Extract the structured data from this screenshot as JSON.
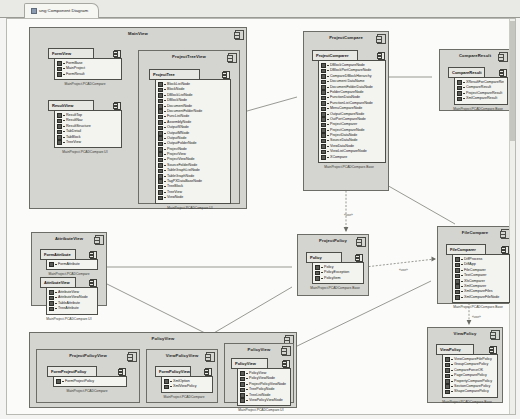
{
  "tab": {
    "label": "ung Component Diagram",
    "icon": "diagram-icon"
  },
  "colors": {
    "package_fill": "#d4d4d0",
    "component_fill": "#f3f3f0",
    "component_header_fill": "#e7e7e3",
    "canvas": "#fbfbf9",
    "line": "#6d6d68"
  },
  "packages": [
    {
      "id": "mainview",
      "name": "MainView",
      "x": 22,
      "y": 8,
      "w": 218,
      "h": 182,
      "components": [
        {
          "id": "formview",
          "name": "FormView",
          "x": 18,
          "y": 20,
          "w": 74,
          "h": 40,
          "footer": "MainProject.PCADCompare",
          "items": [
            "FormBase",
            "MainProject",
            "FormResult"
          ]
        },
        {
          "id": "resultview",
          "name": "ResultView",
          "x": 18,
          "y": 72,
          "w": 74,
          "h": 58,
          "footer": "MainProject.PCADCompare.UI",
          "items": [
            "ResultTop",
            "ResultNav",
            "ResultStructure",
            "TabDetail",
            "TabBlock",
            "TreeView"
          ]
        }
      ],
      "subpackages": [
        {
          "id": "projecttreeview",
          "name": "ProjectTreeView",
          "x": 108,
          "y": 22,
          "w": 102,
          "h": 154,
          "components": [
            {
              "id": "projecttree",
              "name": "ProjectTree",
              "x": 10,
              "y": 18,
              "w": 82,
              "h": 124,
              "footer": "MainProject.PCADCompare.UI",
              "items": [
                "BlockListNode",
                "BlockNode",
                "DBlockListNode",
                "DBlockNode",
                "DocumentNode",
                "DocumentFolderNode",
                "FuncListNode",
                "AssemblyNode",
                "OutputSNode",
                "OutputMNode",
                "OutputNode",
                "OutputFolderNode",
                "ProjectNode",
                "ProjectView",
                "ProjectViewNode",
                "SourceFolderNode",
                "TableGraphListNode",
                "TableGraphNode",
                "TagPXDataBaseNode",
                "TreeBlock",
                "TreeView",
                "ViewNode"
              ]
            }
          ]
        }
      ]
    },
    {
      "id": "projectcompare",
      "name": "ProjectCompare",
      "x": 296,
      "y": 12,
      "w": 86,
      "h": 160,
      "components": [
        {
          "id": "projectcomparer",
          "name": "ProjectComparer",
          "x": 8,
          "y": 18,
          "w": 74,
          "h": 128,
          "footer": "MainProject.PCADCompare.Base",
          "items": [
            "DBlockCompareNode",
            "DBlockPortCompareNode",
            "CompareDBlockHierarchy",
            "Document DataName",
            "DocumentFolderDataNode",
            "FolderCompareNode",
            "FunctionDataNode",
            "FunctionListCompareNode",
            "MenuCompareNode",
            "OutputCompareNode",
            "OutPortCompareNode",
            "ProjectComparer",
            "ProjectCompareNode",
            "ProjectDataNode",
            "SourceDataNode",
            "ViewDataNode",
            "ViewListCompareNode",
            "XCompare"
          ]
        }
      ]
    },
    {
      "id": "compareresult",
      "name": "CompareResult",
      "x": 432,
      "y": 30,
      "w": 72,
      "h": 62,
      "components": [
        {
          "id": "compareresult-comp",
          "name": "CompareResult",
          "x": 8,
          "y": 17,
          "w": 60,
          "h": 36,
          "footer": "MainProject.PCADCompare.Base",
          "items": [
            "XResultForCompareResult",
            "CompareResult",
            "ProjectCompareResult",
            "XmlCompareResult"
          ]
        }
      ]
    },
    {
      "id": "filecompare",
      "name": "FileCompare",
      "x": 430,
      "y": 207,
      "w": 76,
      "h": 78,
      "components": [
        {
          "id": "filecomparer",
          "name": "FileComparer",
          "x": 8,
          "y": 17,
          "w": 64,
          "h": 52,
          "footer": "MainProject.PCADCompare.Base",
          "items": [
            "DiffProcess",
            "DiffApp",
            "FileComparer",
            "TextComparer",
            "XlsComparer",
            "XmlComparer",
            "XmlCompareFiles",
            "XmlCompareFileNode"
          ]
        }
      ]
    },
    {
      "id": "projectpolicy",
      "name": "ProjectPolicy",
      "x": 290,
      "y": 215,
      "w": 72,
      "h": 62,
      "components": [
        {
          "id": "policy",
          "name": "Policy",
          "x": 8,
          "y": 17,
          "w": 58,
          "h": 32,
          "footer": "MainProject.PCADCompare.Base",
          "items": [
            "Policy",
            "PolicyException",
            "PolicyItem"
          ]
        }
      ]
    },
    {
      "id": "attributeview",
      "name": "AttributeView",
      "x": 24,
      "y": 213,
      "w": 76,
      "h": 74,
      "components": [
        {
          "id": "formattribute",
          "name": "FormAttribute",
          "x": 8,
          "y": 16,
          "w": 58,
          "h": 22,
          "footer": "MainProject.PCADCompare",
          "items": [
            "FormAttribute"
          ]
        },
        {
          "id": "attributeview-comp",
          "name": "AttributeView",
          "x": 8,
          "y": 44,
          "w": 58,
          "h": 30,
          "footer": "MainProject.PCADCompare.UI",
          "items": [
            "AttributeView",
            "AttributeViewNode",
            "TableAttribute",
            "TreeAttribute"
          ]
        }
      ]
    },
    {
      "id": "policyview",
      "name": "PolicyView",
      "x": 22,
      "y": 313,
      "w": 268,
      "h": 76,
      "components": [],
      "subpackages": [
        {
          "id": "projectpolicyview",
          "name": "ProjectPolicyView",
          "x": 6,
          "y": 16,
          "w": 104,
          "h": 54,
          "components": [
            {
              "id": "formprojectpolicy",
              "name": "FormProjectPolicy",
              "x": 10,
              "y": 16,
              "w": 80,
              "h": 24,
              "footer": "MainProject.PCADCompare",
              "items": [
                "FormProjectPolicy"
              ]
            }
          ]
        },
        {
          "id": "viewpolicyview",
          "name": "ViewPolicyView",
          "x": 116,
          "y": 16,
          "w": 72,
          "h": 54,
          "components": [
            {
              "id": "formpolicyview",
              "name": "FormPolicyView",
              "x": 8,
              "y": 16,
              "w": 58,
              "h": 26,
              "footer": "MainProject.PCADCompare",
              "items": [
                "XmlOption",
                "XmlViewPolicy"
              ]
            }
          ]
        },
        {
          "id": "policyview-inner",
          "name": "PolicyView",
          "x": 194,
          "y": 10,
          "w": 70,
          "h": 60,
          "components": [
            {
              "id": "policyview-comp",
              "name": "PolicyView",
              "x": 6,
              "y": 14,
              "w": 60,
              "h": 40,
              "footer": "MainProject.PCADCompare.UI",
              "items": [
                "PolicyView",
                "PolicyViewNode",
                "ProjectPolicyViewNode",
                "TreePolicyNode",
                "TreeListNode",
                "ViewPolicyViewNode"
              ]
            }
          ]
        }
      ]
    },
    {
      "id": "viewpolicy",
      "name": "ViewPolicy",
      "x": 420,
      "y": 308,
      "w": 76,
      "h": 76,
      "components": [
        {
          "id": "viewpolicy-comp",
          "name": "ViewPolicy",
          "x": 8,
          "y": 16,
          "w": 62,
          "h": 52,
          "footer": "MainProject.PCADCompare.Base",
          "items": [
            "ViewCompareFilePolicy",
            "GroupComparePolicy",
            "CompareForceOK",
            "PageComparePolicy",
            "PropertyComparePolicy",
            "SectionComparePolicy",
            "ShapeComparePolicy"
          ]
        }
      ]
    }
  ],
  "connector_labels": [
    {
      "text": "«use»",
      "x": 337,
      "y": 194
    },
    {
      "text": "«use»",
      "x": 392,
      "y": 249
    },
    {
      "text": "«use»",
      "x": 465,
      "y": 296
    }
  ]
}
